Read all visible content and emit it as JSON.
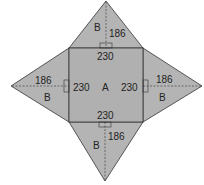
{
  "diagram": {
    "colors": {
      "fill": "#b4b4b4",
      "stroke": "#333333",
      "background": "#ffffff"
    },
    "base": {
      "label": "A",
      "side": "230"
    },
    "faces": [
      {
        "id": "top",
        "label": "B",
        "base": "230",
        "height": "186"
      },
      {
        "id": "left",
        "label": "B",
        "base": "230",
        "height": "186"
      },
      {
        "id": "right",
        "label": "B",
        "base": "230",
        "height": "186"
      },
      {
        "id": "bottom",
        "label": "B",
        "base": "230",
        "height": "186"
      }
    ]
  }
}
